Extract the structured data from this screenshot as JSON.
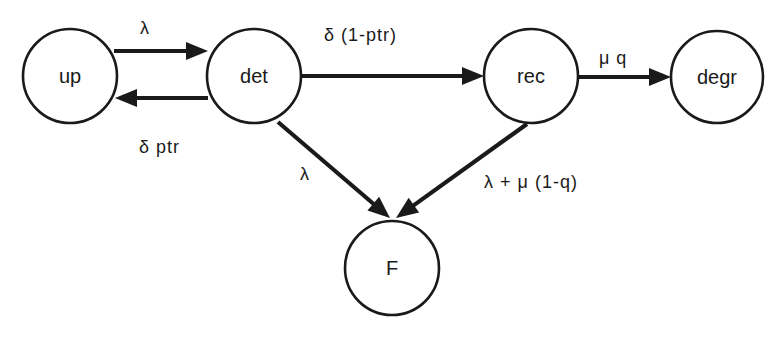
{
  "diagram": {
    "type": "state-transition",
    "background": "#ffffff",
    "stroke_color": "#1a1a1a",
    "nodes": [
      {
        "id": "up",
        "label": "up",
        "cx": 70,
        "cy": 76,
        "r": 47
      },
      {
        "id": "det",
        "label": "det",
        "cx": 254,
        "cy": 76,
        "r": 47
      },
      {
        "id": "rec",
        "label": "rec",
        "cx": 531,
        "cy": 76,
        "r": 47
      },
      {
        "id": "degr",
        "label": "degr",
        "cx": 717,
        "cy": 77,
        "r": 46
      },
      {
        "id": "F",
        "label": "F",
        "cx": 392,
        "cy": 268,
        "r": 47
      }
    ],
    "edges": [
      {
        "id": "up-det",
        "from": "up",
        "to": "det",
        "label": "λ",
        "x1": 114,
        "y1": 51,
        "x2": 208,
        "y2": 51,
        "label_x": 140,
        "label_y": 28
      },
      {
        "id": "det-up",
        "from": "det",
        "to": "up",
        "label": "δ ptr",
        "x1": 208,
        "y1": 98,
        "x2": 115,
        "y2": 98,
        "label_x": 139,
        "label_y": 147
      },
      {
        "id": "det-rec",
        "from": "det",
        "to": "rec",
        "label": "δ (1-ptr)",
        "x1": 301,
        "y1": 76,
        "x2": 484,
        "y2": 76,
        "label_x": 324,
        "label_y": 35
      },
      {
        "id": "rec-degr",
        "from": "rec",
        "to": "degr",
        "label": "μ q",
        "x1": 578,
        "y1": 77,
        "x2": 671,
        "y2": 77,
        "label_x": 599,
        "label_y": 58
      },
      {
        "id": "det-F",
        "from": "det",
        "to": "F",
        "label": "λ",
        "x1": 278,
        "y1": 122,
        "x2": 390,
        "y2": 218,
        "label_x": 300,
        "label_y": 174
      },
      {
        "id": "rec-F",
        "from": "rec",
        "to": "F",
        "label": "λ + μ (1-q)",
        "x1": 527,
        "y1": 124,
        "x2": 396,
        "y2": 218,
        "label_x": 484,
        "label_y": 182
      }
    ]
  }
}
